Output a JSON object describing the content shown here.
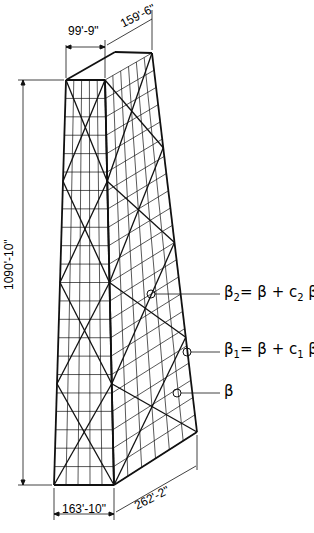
{
  "diagram": {
    "dimensions": {
      "top_front_width": "99'-9\"",
      "top_side_width": "159'-6\"",
      "height": "1090'-10\"",
      "bottom_front_width": "163'-10\"",
      "bottom_side_width": "262'-2\""
    },
    "annotations": [
      {
        "id": "beta2",
        "text_main": "β",
        "sub": "2",
        "rest": "= β + c",
        "sub2": "2",
        "tail": " β"
      },
      {
        "id": "beta1",
        "text_main": "β",
        "sub": "1",
        "rest": "= β + c",
        "sub2": "1",
        "tail": " β"
      },
      {
        "id": "beta",
        "text_main": "β"
      }
    ],
    "colors": {
      "ink": "#111111",
      "background": "#ffffff"
    }
  }
}
